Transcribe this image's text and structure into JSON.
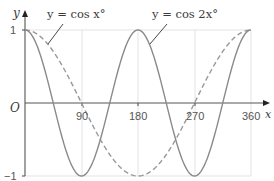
{
  "chart_data": {
    "type": "line",
    "title": "",
    "xlabel": "x",
    "ylabel": "y",
    "origin_label": "O",
    "xlim": [
      0,
      360
    ],
    "ylim": [
      -1,
      1
    ],
    "x_ticks": [
      90,
      180,
      270,
      360
    ],
    "x_tick_labels": [
      "90",
      "180",
      "270",
      "360"
    ],
    "y_ticks": [
      1,
      -1
    ],
    "y_tick_labels": [
      "1",
      "−1"
    ],
    "grid": true,
    "legend": "annotations",
    "series": [
      {
        "name": "y = cos x°",
        "style": "dashed",
        "color": "#9a9a9a",
        "x": [
          0,
          45,
          90,
          135,
          180,
          225,
          270,
          315,
          360
        ],
        "values": [
          1,
          0.707,
          0,
          -0.707,
          -1,
          -0.707,
          0,
          0.707,
          1
        ]
      },
      {
        "name": "y = cos 2x°",
        "style": "solid",
        "color": "#8a8a8a",
        "x": [
          0,
          45,
          90,
          135,
          180,
          225,
          270,
          315,
          360
        ],
        "values": [
          1,
          0,
          -1,
          0,
          1,
          0,
          -1,
          0,
          1
        ]
      }
    ],
    "annotations": [
      {
        "text": "y = cos x°",
        "points_to": "dashed curve near x≈40"
      },
      {
        "text": "y = cos 2x°",
        "points_to": "solid curve near x≈200"
      }
    ]
  },
  "labels": {
    "y_axis": "y",
    "x_axis": "x",
    "origin": "O",
    "y_one": "1",
    "y_minus_one": "−1",
    "x90": "90",
    "x180": "180",
    "x270": "270",
    "x360": "360",
    "ann_cosx": "y = cos x°",
    "ann_cos2x": "y = cos 2x°"
  }
}
